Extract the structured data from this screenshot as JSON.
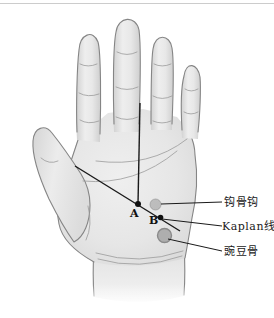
{
  "page": {
    "background": "#ffffff",
    "top_rule_color": "#cccccc"
  },
  "diagram": {
    "name": "palmar-hand-kaplan-cardinal-line-illustration",
    "hand": {
      "fill": "#e7e7e7",
      "shade": "#d3d3d3",
      "outline": "#858585",
      "crease_color": "#9a9a9a"
    },
    "markers": {
      "point_a": {
        "label": "A"
      },
      "point_b": {
        "label": "B"
      },
      "point_color": "#111111",
      "hamate_dot_color": "#aaaaaa",
      "pisiform_dot_color": "#a5a5a5"
    },
    "annotation_color": "#1a1a1a",
    "callouts": [
      {
        "id": "hamate-hook",
        "label": "钩骨钩"
      },
      {
        "id": "kaplan-line",
        "label": "Kaplan线"
      },
      {
        "id": "pisiform",
        "label": "豌豆骨"
      }
    ]
  }
}
